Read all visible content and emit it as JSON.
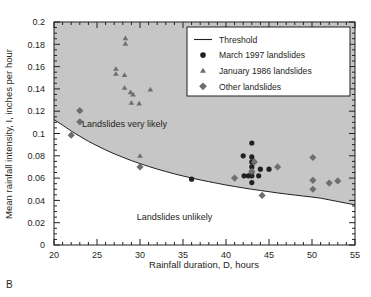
{
  "figure": {
    "panel_label": "B",
    "background_color": "#ffffff",
    "shaded_region_color": "#c6c6c6",
    "frame_color": "#231f20"
  },
  "chart_data": {
    "type": "scatter",
    "title": "",
    "xlabel": "Rainfall duration, D, hours",
    "ylabel": "Mean rainfall intensity, I, inches per hour",
    "xlim": [
      20,
      55
    ],
    "ylim": [
      0,
      0.2
    ],
    "xticks": [
      20,
      25,
      30,
      35,
      40,
      45,
      50,
      55
    ],
    "xtick_labels": [
      "20",
      "25",
      "30",
      "35",
      "40",
      "45",
      "50",
      "55"
    ],
    "xminor_step": 1,
    "yticks": [
      0,
      0.02,
      0.04,
      0.06,
      0.08,
      0.1,
      0.12,
      0.14,
      0.16,
      0.18,
      0.2
    ],
    "ytick_labels": [
      "0",
      "0.02",
      "0.04",
      "0.06",
      "0.08",
      "0.1",
      "0.12",
      "0.14",
      "0.16",
      "0.18",
      "0.2"
    ],
    "yminor_step": 0.005,
    "grid": false,
    "legend_position": "top-right",
    "annotations": [
      {
        "text": "Landslides very likely",
        "x": 28.2,
        "y": 0.1055
      },
      {
        "text": "Landslides unlikely",
        "x": 34.0,
        "y": 0.0225
      }
    ],
    "threshold": {
      "name": "Threshold",
      "color": "#231f20",
      "points": [
        {
          "x": 20.0,
          "y": 0.1125
        },
        {
          "x": 21.0,
          "y": 0.1075
        },
        {
          "x": 22.0,
          "y": 0.1022
        },
        {
          "x": 23.0,
          "y": 0.0975
        },
        {
          "x": 24.0,
          "y": 0.093
        },
        {
          "x": 25.0,
          "y": 0.089
        },
        {
          "x": 26.0,
          "y": 0.0853
        },
        {
          "x": 27.0,
          "y": 0.0818
        },
        {
          "x": 28.0,
          "y": 0.0787
        },
        {
          "x": 29.0,
          "y": 0.0757
        },
        {
          "x": 30.0,
          "y": 0.073
        },
        {
          "x": 31.0,
          "y": 0.0705
        },
        {
          "x": 32.0,
          "y": 0.0681
        },
        {
          "x": 33.0,
          "y": 0.0659
        },
        {
          "x": 34.0,
          "y": 0.0638
        },
        {
          "x": 35.0,
          "y": 0.0619
        },
        {
          "x": 36.0,
          "y": 0.0601
        },
        {
          "x": 37.0,
          "y": 0.0584
        },
        {
          "x": 38.0,
          "y": 0.0568
        },
        {
          "x": 39.0,
          "y": 0.0553
        },
        {
          "x": 40.0,
          "y": 0.0538
        },
        {
          "x": 41.0,
          "y": 0.0525
        },
        {
          "x": 42.0,
          "y": 0.0512
        },
        {
          "x": 43.0,
          "y": 0.05
        },
        {
          "x": 44.0,
          "y": 0.0489
        },
        {
          "x": 45.0,
          "y": 0.0478
        },
        {
          "x": 46.0,
          "y": 0.0467
        },
        {
          "x": 47.0,
          "y": 0.0457
        },
        {
          "x": 48.0,
          "y": 0.0448
        },
        {
          "x": 49.0,
          "y": 0.0439
        },
        {
          "x": 50.0,
          "y": 0.043
        },
        {
          "x": 51.0,
          "y": 0.042
        },
        {
          "x": 52.0,
          "y": 0.0405
        },
        {
          "x": 53.0,
          "y": 0.039
        },
        {
          "x": 54.0,
          "y": 0.0375
        },
        {
          "x": 55.0,
          "y": 0.036
        }
      ]
    },
    "series": [
      {
        "name": "March 1997 landslides",
        "marker": "circle",
        "color": "#231f20",
        "points": [
          {
            "x": 36.0,
            "y": 0.059
          },
          {
            "x": 42.0,
            "y": 0.08
          },
          {
            "x": 42.1,
            "y": 0.062
          },
          {
            "x": 42.6,
            "y": 0.062
          },
          {
            "x": 43.0,
            "y": 0.0915
          },
          {
            "x": 43.0,
            "y": 0.079
          },
          {
            "x": 43.0,
            "y": 0.0745
          },
          {
            "x": 43.0,
            "y": 0.07
          },
          {
            "x": 43.0,
            "y": 0.0655
          },
          {
            "x": 43.0,
            "y": 0.062
          },
          {
            "x": 43.0,
            "y": 0.056
          },
          {
            "x": 43.8,
            "y": 0.062
          },
          {
            "x": 44.0,
            "y": 0.068
          },
          {
            "x": 45.0,
            "y": 0.068
          }
        ]
      },
      {
        "name": "January 1986 landslides",
        "marker": "triangle",
        "color": "#6d6e70",
        "points": [
          {
            "x": 28.3,
            "y": 0.1855
          },
          {
            "x": 28.3,
            "y": 0.1805
          },
          {
            "x": 27.2,
            "y": 0.158
          },
          {
            "x": 27.2,
            "y": 0.1535
          },
          {
            "x": 28.2,
            "y": 0.1525
          },
          {
            "x": 28.2,
            "y": 0.141
          },
          {
            "x": 28.9,
            "y": 0.137
          },
          {
            "x": 29.2,
            "y": 0.135
          },
          {
            "x": 31.2,
            "y": 0.1395
          },
          {
            "x": 29.0,
            "y": 0.1275
          },
          {
            "x": 29.9,
            "y": 0.127
          },
          {
            "x": 30.0,
            "y": 0.08
          }
        ]
      },
      {
        "name": "Other landslides",
        "marker": "diamond",
        "color": "#6d6e70",
        "points": [
          {
            "x": 23.0,
            "y": 0.1205
          },
          {
            "x": 23.0,
            "y": 0.1105
          },
          {
            "x": 22.0,
            "y": 0.0985
          },
          {
            "x": 30.0,
            "y": 0.07
          },
          {
            "x": 41.0,
            "y": 0.06
          },
          {
            "x": 43.3,
            "y": 0.0745
          },
          {
            "x": 43.0,
            "y": 0.066
          },
          {
            "x": 44.2,
            "y": 0.0445
          },
          {
            "x": 46.0,
            "y": 0.07
          },
          {
            "x": 50.1,
            "y": 0.0785
          },
          {
            "x": 50.1,
            "y": 0.058
          },
          {
            "x": 50.1,
            "y": 0.05
          },
          {
            "x": 52.0,
            "y": 0.0555
          },
          {
            "x": 53.0,
            "y": 0.0575
          }
        ]
      }
    ],
    "legend_entries": [
      {
        "label": "Threshold",
        "marker": "line",
        "color": "#231f20"
      },
      {
        "label": "March 1997 landslides",
        "marker": "circle",
        "color": "#231f20"
      },
      {
        "label": "January 1986 landslides",
        "marker": "triangle",
        "color": "#6d6e70"
      },
      {
        "label": "Other landslides",
        "marker": "diamond",
        "color": "#6d6e70"
      }
    ]
  }
}
